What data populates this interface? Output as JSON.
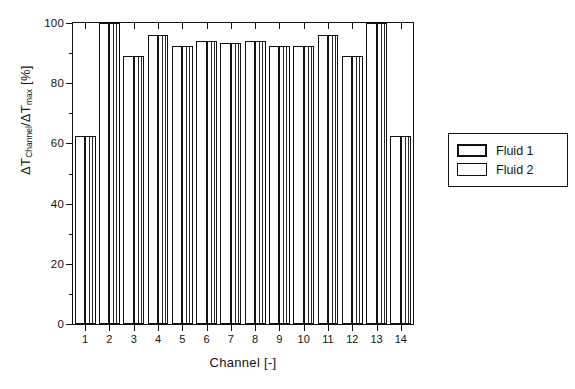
{
  "chart_data": {
    "type": "bar",
    "title": "",
    "xlabel": "Channel [-]",
    "ylabel": "ΔT_Channel / ΔT_max  [%]",
    "ylabel_parts": {
      "d1": "ΔT",
      "sub1": "Channel",
      "slash": "/ΔT",
      "sub2": "max",
      "unit": " [%]"
    },
    "categories": [
      "1",
      "2",
      "3",
      "4",
      "5",
      "6",
      "7",
      "8",
      "9",
      "10",
      "11",
      "12",
      "13",
      "14"
    ],
    "series": [
      {
        "name": "Fluid 1",
        "values": [
          62.5,
          100,
          89,
          96,
          92.5,
          94,
          93.5,
          94,
          92.5,
          92.5,
          96,
          89,
          100,
          62.5
        ]
      },
      {
        "name": "Fluid 2",
        "values": [
          62.5,
          100,
          89,
          96,
          92.5,
          94,
          93.5,
          94,
          92.5,
          92.5,
          96,
          89,
          100,
          62.5
        ]
      }
    ],
    "xlim": [
      0.5,
      14.5
    ],
    "ylim": [
      0,
      100
    ],
    "ytick_major": [
      0,
      20,
      40,
      60,
      80,
      100
    ],
    "ytick_minor": [
      10,
      30,
      50,
      70,
      90
    ],
    "grid": false,
    "legend_position": "right-outside",
    "legend_entries": [
      "Fluid 1",
      "Fluid 2"
    ]
  },
  "legend": {
    "items": [
      {
        "label": "Fluid 1",
        "style": "f1"
      },
      {
        "label": "Fluid 2",
        "style": "f2"
      }
    ]
  }
}
